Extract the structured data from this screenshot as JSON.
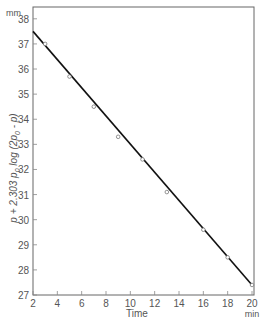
{
  "chart_data": {
    "type": "scatter",
    "title": "",
    "xlabel": "Time",
    "xunit": "min",
    "ylabel": "p + 2.303 p0 log (2p0 - p)",
    "ylabel_parts": {
      "main": "p + 2.303 ",
      "p0a": "p",
      "sub0a": "0",
      "log": " log (2",
      "p0b": "p",
      "sub0b": "0",
      "tail": " - p)"
    },
    "yunit": "mm",
    "xlim": [
      2,
      20
    ],
    "ylim": [
      27,
      38.5
    ],
    "xticks": [
      2,
      4,
      6,
      8,
      10,
      12,
      14,
      16,
      18,
      20
    ],
    "yticks": [
      27,
      28,
      29,
      30,
      31,
      32,
      33,
      34,
      35,
      36,
      37,
      38
    ],
    "grid": false,
    "series": [
      {
        "name": "measured",
        "marker": "open-circle",
        "x": [
          3,
          5,
          7,
          9,
          11,
          13,
          16,
          18,
          20
        ],
        "y": [
          37.0,
          35.7,
          34.5,
          33.3,
          32.4,
          31.1,
          29.6,
          28.5,
          27.4
        ]
      },
      {
        "name": "fit",
        "style": "line",
        "x": [
          2,
          20
        ],
        "y": [
          37.5,
          27.4
        ]
      }
    ]
  }
}
